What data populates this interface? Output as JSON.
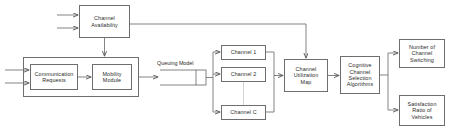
{
  "diagram": {
    "stroke_color": "#6e6e6e",
    "text_color": "#2b2b2b",
    "background": "#ffffff",
    "nodes": {
      "channel_availability": "Channel\nAvailability",
      "communication_requests": "Communication\nRequests",
      "mobility_module": "Mobility\nModule",
      "queuing_model": "Queuing Model",
      "channel_1": "Channel 1",
      "channel_2": "Channel 2",
      "channel_c": "Channel C",
      "channel_utilization_map": "Channel\nUtilization\nMap",
      "cognitive_algorithms": "Cognitive\nChannel\nSelection\nAlgorithms",
      "number_of_channel_switching": "Number of\nChannel\nSwitching",
      "satisfaction_ratio_of_vehicles": "Satisfaction\nRatio of\nVehicles"
    }
  }
}
